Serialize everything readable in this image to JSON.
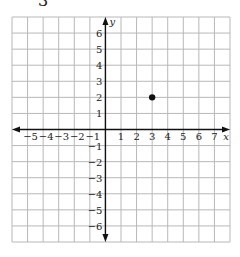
{
  "problem_number": "3",
  "chart_data": {
    "type": "scatter",
    "title": "",
    "xlabel": "x",
    "ylabel": "y",
    "xlim": [
      -6,
      8
    ],
    "ylim": [
      -7,
      7
    ],
    "grid": true,
    "x_tick_labels": [
      "−5",
      "−4",
      "−3",
      "−2",
      "−1",
      "1",
      "2",
      "3",
      "4",
      "5",
      "6",
      "7"
    ],
    "x_ticks": [
      -5,
      -4,
      -3,
      -2,
      -1,
      1,
      2,
      3,
      4,
      5,
      6,
      7
    ],
    "y_tick_labels": [
      "6",
      "5",
      "4",
      "3",
      "2",
      "1",
      "−1",
      "−2",
      "−3",
      "−4",
      "−5",
      "−6"
    ],
    "y_ticks": [
      6,
      5,
      4,
      3,
      2,
      1,
      -1,
      -2,
      -3,
      -4,
      -5,
      -6
    ],
    "points": [
      {
        "x": 3,
        "y": 2
      }
    ],
    "colors": {
      "grid": "#b8b8b8",
      "axis": "#111111",
      "point": "#111111"
    }
  }
}
